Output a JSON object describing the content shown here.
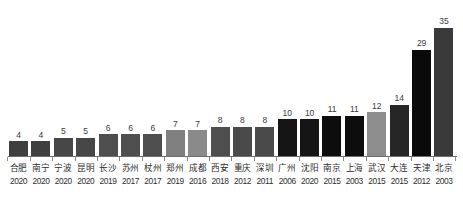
{
  "chart_data": {
    "type": "bar",
    "title": "",
    "subtitle": "",
    "xlabel": "",
    "ylabel": "",
    "ylim": [
      0,
      38
    ],
    "grid": false,
    "legend": false,
    "orientation": "vertical",
    "value_labels_shown": true,
    "categories": [
      "合肥",
      "南宁",
      "宁波",
      "昆明",
      "长沙",
      "苏州",
      "杖州",
      "郑州",
      "成都",
      "西安",
      "重庆",
      "深圳",
      "广州",
      "沈阳",
      "南京",
      "上海",
      "武汉",
      "大连",
      "天津",
      "北京"
    ],
    "secondary_labels": [
      "2020",
      "2020",
      "2020",
      "2020",
      "2019",
      "2017",
      "2017",
      "2019",
      "2016",
      "2018",
      "2012",
      "2011",
      "2006",
      "2020",
      "2015",
      "2003",
      "2015",
      "2015",
      "2012",
      "2003"
    ],
    "values": [
      4,
      4,
      5,
      5,
      6,
      6,
      6,
      7,
      7,
      8,
      8,
      8,
      10,
      10,
      11,
      11,
      12,
      14,
      29,
      35
    ],
    "bar_colors": [
      "#3f3f3f",
      "#3f3f3f",
      "#474747",
      "#474747",
      "#4e4e4e",
      "#4e4e4e",
      "#4e4e4e",
      "#808080",
      "#8a8a8a",
      "#4e4e4e",
      "#4a4a4a",
      "#4a4a4a",
      "#151515",
      "#151515",
      "#0d0d0d",
      "#0d0d0d",
      "#8d8d8d",
      "#262626",
      "#0a0a0a",
      "#3a3a3a"
    ],
    "value_label_color": "#3b3b3b",
    "axis_color": "#6e6e6e"
  }
}
